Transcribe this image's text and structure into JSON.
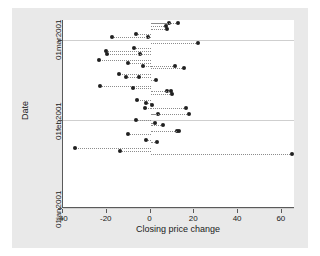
{
  "chart_data": {
    "type": "scatter",
    "title": "",
    "xlabel": "Closing price change",
    "ylabel": "Date",
    "xlim": [
      -40,
      66
    ],
    "ylim": [
      "01jan2001",
      "08mar2001"
    ],
    "grid": true,
    "legend": "none",
    "marker": "filled-circle",
    "leader_lines": "dotted horizontal from x=0 to each point",
    "xticks": [
      -40,
      -20,
      0,
      20,
      40,
      60
    ],
    "xticklabels": [
      "-40",
      "-20",
      "0",
      "20",
      "40",
      "60"
    ],
    "yticks": [
      "01jan2001",
      "01feb2001",
      "01mar2001"
    ],
    "yticklabels": [
      "01jan2001",
      "01feb2001",
      "01mar2001"
    ],
    "x": [
      8.5,
      12.5,
      7.0,
      7.5,
      -6.5,
      -1.0,
      -17.5,
      21.5,
      -7.5,
      -20.5,
      -5.0,
      -20.0,
      -23.5,
      -10.5,
      -3.5,
      11.0,
      15.5,
      -14.5,
      -11.0,
      -5.5,
      2.5,
      -23.0,
      -8.0,
      7.5,
      9.5,
      10.0,
      -6.0,
      -2.0,
      0.5,
      -2.5,
      16.0,
      3.5,
      17.5,
      -6.5,
      2.0,
      5.5,
      12.0,
      13.0,
      -10.5,
      -2.0,
      3.0,
      -34.5,
      -14.0,
      64.5
    ],
    "y": [
      "07mar2001",
      "07mar2001",
      "06mar2001",
      "05mar2001",
      "03mar2001",
      "02mar2001",
      "02mar2001",
      "28feb2001",
      "26feb2001",
      "25feb2001",
      "24feb2001",
      "24feb2001",
      "22feb2001",
      "21feb2001",
      "20feb2001",
      "20feb2001",
      "19feb2001",
      "17feb2001",
      "16feb2001",
      "16feb2001",
      "15feb2001",
      "13feb2001",
      "12feb2001",
      "11feb2001",
      "11feb2001",
      "10feb2001",
      "08feb2001",
      "07feb2001",
      "06feb2001",
      "05feb2001",
      "05feb2001",
      "03feb2001",
      "03feb2001",
      "01feb2001",
      "31jan2001",
      "30jan2001",
      "28jan2001",
      "28jan2001",
      "27jan2001",
      "25jan2001",
      "24jan2001",
      "22jan2001",
      "21jan2001",
      "20jan2001"
    ],
    "n_points": 44
  },
  "colors": {
    "figure_background": "#e9e9e9",
    "plot_background": "#ffffff",
    "marker": "#202020",
    "axis": "#5a5a5a",
    "gridline": "#cfcfcf",
    "leader": "#8c8c8c"
  }
}
